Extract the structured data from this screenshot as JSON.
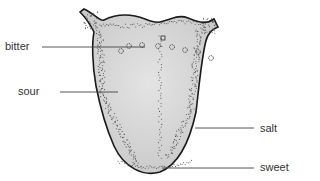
{
  "diagram": {
    "colors": {
      "tongue_fill": "#d6d6d6",
      "outline": "#1a1a1a",
      "leader_line": "#444444",
      "dots": "#555555",
      "label_text": "#333333"
    },
    "labels": [
      {
        "id": "bitter",
        "text": "bitter"
      },
      {
        "id": "sour",
        "text": "sour"
      },
      {
        "id": "salt",
        "text": "salt"
      },
      {
        "id": "sweet",
        "text": "sweet"
      }
    ]
  }
}
